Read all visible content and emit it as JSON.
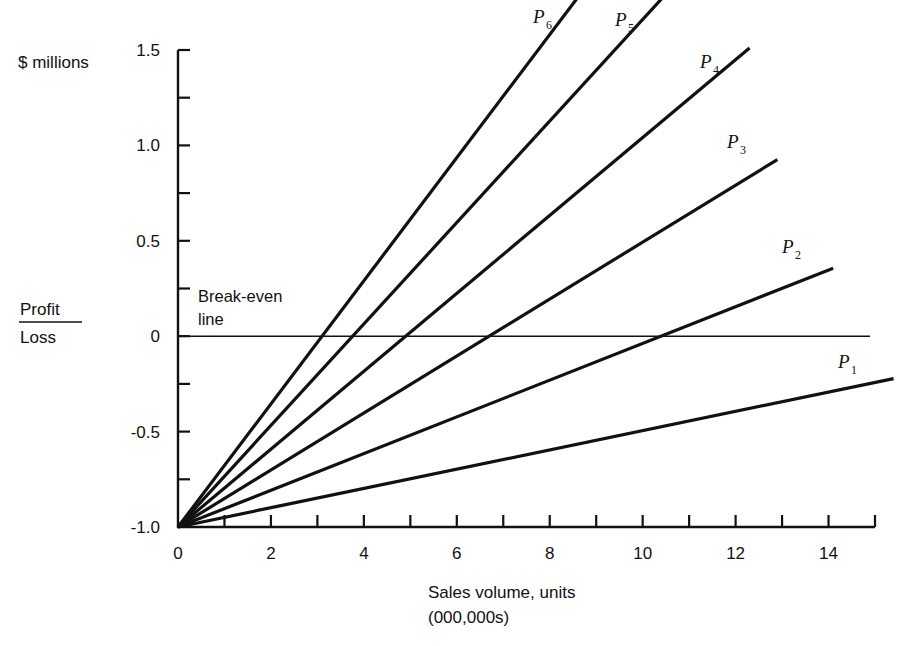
{
  "chart_data": {
    "type": "line",
    "title": "",
    "subtitle": "",
    "xlabel": "Sales volume, units",
    "xlabel_line2": "(000,000s)",
    "ylabel_unit": "$ millions",
    "ylabel_frac_numerator": "Profit",
    "ylabel_frac_denominator": "Loss",
    "xlim": [
      0,
      15
    ],
    "ylim": [
      -1.0,
      1.5
    ],
    "x_ticks_all": [
      0,
      1,
      2,
      3,
      4,
      5,
      6,
      7,
      8,
      9,
      10,
      11,
      12,
      13,
      14,
      15
    ],
    "x_tick_labels": [
      "0",
      "2",
      "4",
      "6",
      "8",
      "10",
      "12",
      "14"
    ],
    "x_tick_label_values": [
      0,
      2,
      4,
      6,
      8,
      10,
      12,
      14
    ],
    "y_ticks_all": [
      -1.0,
      -0.75,
      -0.5,
      -0.25,
      0,
      0.25,
      0.5,
      0.75,
      1.0,
      1.25,
      1.5
    ],
    "y_tick_labels": [
      "1.5",
      "1.0",
      "0.5",
      "0",
      "-0.5",
      "-1.0"
    ],
    "y_tick_label_values": [
      1.5,
      1.0,
      0.5,
      0,
      -0.5,
      -1.0
    ],
    "grid": false,
    "legend_position": "inline-end-of-line",
    "annotations": [
      {
        "name": "break-even-line-label",
        "text_line1": "Break-even",
        "text_line2": "line",
        "x": 0.4,
        "y": 0.22
      }
    ],
    "break_even_value": 0,
    "common_intercept": -1.0,
    "series": [
      {
        "name": "P1",
        "label": "P",
        "subscript": "1",
        "intercept": -1.0,
        "slope": 0.0505,
        "x_end": 15.4,
        "y_end": -0.22,
        "break_even_x": null
      },
      {
        "name": "P2",
        "label": "P",
        "subscript": "2",
        "intercept": -1.0,
        "slope": 0.0962,
        "x_end": 14.1,
        "y_end": 0.36,
        "break_even_x": 10.4
      },
      {
        "name": "P3",
        "label": "P",
        "subscript": "3",
        "intercept": -1.0,
        "slope": 0.1493,
        "x_end": 12.9,
        "y_end": 0.93,
        "break_even_x": 6.7
      },
      {
        "name": "P4",
        "label": "P",
        "subscript": "4",
        "intercept": -1.0,
        "slope": 0.2041,
        "x_end": 12.3,
        "y_end": 1.45,
        "break_even_x": 4.9
      },
      {
        "name": "P5",
        "label": "P",
        "subscript": "5",
        "intercept": -1.0,
        "slope": 0.266,
        "x_end": 10.7,
        "y_end": 1.74,
        "break_even_x": 3.76
      },
      {
        "name": "P6",
        "label": "P",
        "subscript": "6",
        "intercept": -1.0,
        "slope": 0.3226,
        "x_end": 8.84,
        "y_end": 1.76,
        "break_even_x": 3.1
      }
    ],
    "series_labels": [
      {
        "name": "P1",
        "label": "P",
        "subscript": "1",
        "px": 838,
        "py": 368
      },
      {
        "name": "P2",
        "label": "P",
        "subscript": "2",
        "px": 782,
        "py": 253
      },
      {
        "name": "P3",
        "label": "P",
        "subscript": "3",
        "px": 727,
        "py": 148
      },
      {
        "name": "P4",
        "label": "P",
        "subscript": "4",
        "px": 700,
        "py": 68
      },
      {
        "name": "P5",
        "label": "P",
        "subscript": "5",
        "px": 615,
        "py": 26
      },
      {
        "name": "P6",
        "label": "P",
        "subscript": "6",
        "px": 533,
        "py": 23
      }
    ]
  }
}
